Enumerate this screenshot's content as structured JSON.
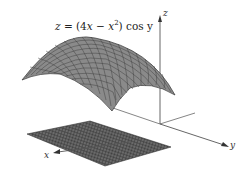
{
  "figure": {
    "equation_parts": {
      "lhs": "z",
      "eq": " = (4",
      "x1": "x",
      "minus": " − ",
      "x2": "x",
      "sup": "2",
      "rest": ") cos y"
    },
    "axes": {
      "x": "x",
      "y": "y",
      "z": "z"
    },
    "surface_description": "Saddle-like arched surface with grid mesh above the xy-plane",
    "plane_description": "Rectangular domain grid in the xy-plane (shadow region)",
    "colors": {
      "surface_fill": "#8a8a8a",
      "surface_grid": "#3a3a3a",
      "plane_fill": "#555555",
      "axis": "#555555"
    }
  }
}
